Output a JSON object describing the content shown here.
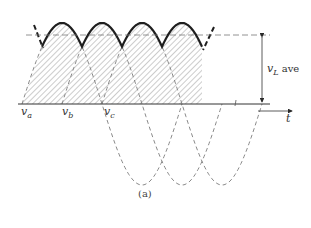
{
  "figure": {
    "caption": "(a)",
    "labels": {
      "va": {
        "main": "v",
        "sub": "a"
      },
      "vb": {
        "main": "v",
        "sub": "b"
      },
      "vc": {
        "main": "v",
        "sub": "c"
      },
      "vL_ave": {
        "main": "v",
        "sub": "L",
        "suffix": " ave"
      },
      "t": "t"
    },
    "colors": {
      "ink": "#2a2a2a",
      "dashed": "#8a8a8a",
      "hatch": "#9a9a9a"
    },
    "waveform": {
      "baseline_y": 104,
      "average_y": 35,
      "peak_y": 23,
      "hump_centers_x": [
        62,
        102,
        142,
        182
      ],
      "half_period_px": 40
    }
  }
}
